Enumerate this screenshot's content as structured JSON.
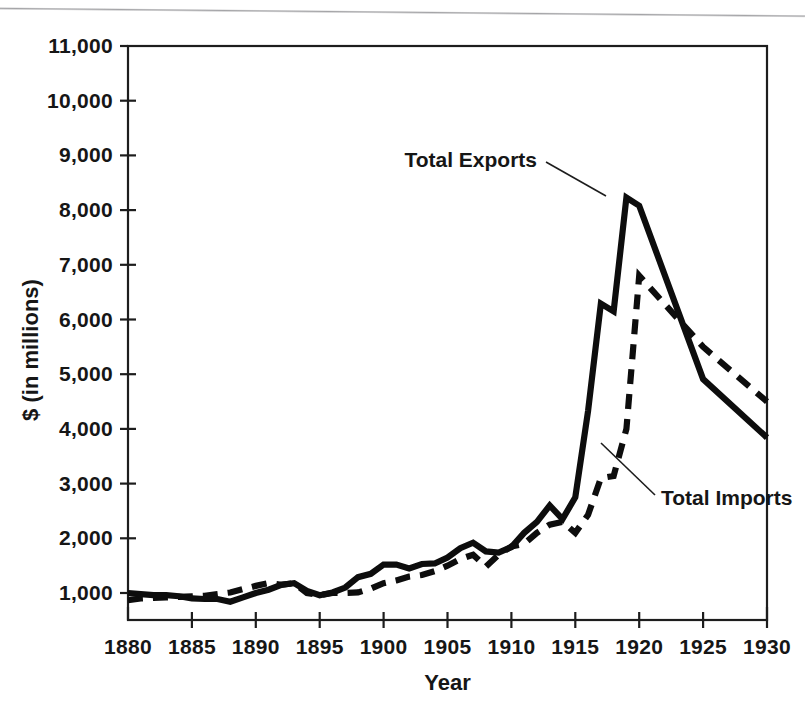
{
  "chart_data": {
    "type": "line",
    "title": "",
    "xlabel": "Year",
    "ylabel": "$ (in millions)",
    "xlim": [
      1880,
      1930
    ],
    "ylim": [
      1000,
      11000
    ],
    "grid": false,
    "legend_position": "inline-annotations",
    "xticks": [
      "1880",
      "1885",
      "1890",
      "1895",
      "1900",
      "1905",
      "1910",
      "1915",
      "1920",
      "1925",
      "1930"
    ],
    "yticks": [
      "1,000",
      "2,000",
      "3,000",
      "4,000",
      "5,000",
      "6,000",
      "7,000",
      "8,000",
      "9,000",
      "10,000",
      "11,000"
    ],
    "x": [
      1880,
      1881,
      1882,
      1883,
      1884,
      1885,
      1886,
      1887,
      1888,
      1889,
      1890,
      1891,
      1892,
      1893,
      1894,
      1895,
      1896,
      1897,
      1898,
      1899,
      1900,
      1901,
      1902,
      1903,
      1904,
      1905,
      1906,
      1907,
      1908,
      1909,
      1910,
      1911,
      1912,
      1913,
      1914,
      1915,
      1916,
      1917,
      1918,
      1919,
      1920,
      1925,
      1930
    ],
    "series": [
      {
        "name": "Total Exports",
        "style": "solid",
        "color": "#0d0d0d",
        "values": [
          1000,
          980,
          960,
          960,
          940,
          900,
          890,
          890,
          840,
          920,
          1000,
          1060,
          1150,
          1180,
          1040,
          960,
          1010,
          1100,
          1290,
          1350,
          1520,
          1520,
          1450,
          1530,
          1540,
          1650,
          1820,
          1920,
          1760,
          1740,
          1840,
          2100,
          2300,
          2600,
          2350,
          2750,
          4330,
          6290,
          6150,
          8230,
          8080,
          4910,
          3840
        ],
        "annotation": "Total Exports"
      },
      {
        "name": "Total Imports",
        "style": "dashed",
        "color": "#0d0d0d",
        "values": [
          870,
          900,
          910,
          920,
          930,
          940,
          950,
          980,
          1010,
          1070,
          1130,
          1180,
          1150,
          1180,
          1000,
          960,
          1000,
          1000,
          1010,
          1080,
          1180,
          1230,
          1300,
          1330,
          1400,
          1500,
          1620,
          1700,
          1480,
          1700,
          1850,
          1900,
          2100,
          2250,
          2300,
          2100,
          2430,
          3100,
          3140,
          4000,
          6800,
          5500,
          4500
        ],
        "annotation": "Total Imports"
      }
    ],
    "annotations": [
      {
        "text": "Total Exports",
        "points_to_year": 1918,
        "points_to_value": 7300
      },
      {
        "text": "Total Imports",
        "points_to_year": 1919,
        "points_to_value": 4850
      }
    ]
  },
  "axes": {
    "y_axis_title": "$ (in millions)",
    "x_axis_title": "Year",
    "y_tick_labels": [
      "11,000",
      "10,000",
      "9,000",
      "8,000",
      "7,000",
      "6,000",
      "5,000",
      "4,000",
      "3,000",
      "2,000",
      "1,000"
    ],
    "x_tick_labels": [
      "1880",
      "1885",
      "1890",
      "1895",
      "1900",
      "1905",
      "1910",
      "1915",
      "1920",
      "1925",
      "1930"
    ]
  },
  "labels": {
    "exports": "Total Exports",
    "imports": "Total Imports"
  },
  "colors": {
    "ink": "#0d0d0d",
    "frame": "#1d1d1d",
    "background": "#ffffff"
  }
}
